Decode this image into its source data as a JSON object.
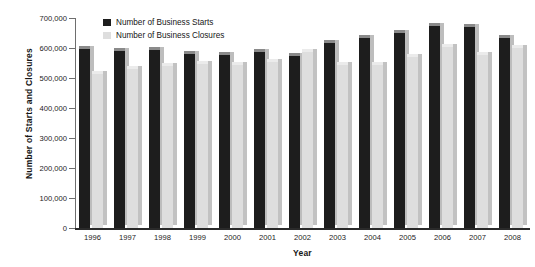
{
  "chart_data": {
    "type": "bar",
    "title": "",
    "xlabel": "Year",
    "ylabel": "Number of Starts and Closures",
    "categories": [
      "1996",
      "1997",
      "1998",
      "1999",
      "2000",
      "2001",
      "2002",
      "2003",
      "2004",
      "2005",
      "2006",
      "2007",
      "2008"
    ],
    "series": [
      {
        "name": "Number of Business Starts",
        "color": "#1d1d1d",
        "values": [
          598000,
          591000,
          593000,
          581000,
          577000,
          588000,
          573000,
          617000,
          633000,
          649000,
          675000,
          670000,
          633000
        ]
      },
      {
        "name": "Number of Business Closures",
        "color": "#dedede",
        "values": [
          512000,
          531000,
          541000,
          546000,
          543000,
          554000,
          587000,
          543000,
          544000,
          571000,
          604000,
          578000,
          601000
        ]
      }
    ],
    "ylim": [
      0,
      700000
    ],
    "yticks": [
      0,
      100000,
      200000,
      300000,
      400000,
      500000,
      600000,
      700000
    ],
    "ytick_labels": [
      "0",
      "100,000",
      "200,000",
      "300,000",
      "400,000",
      "500,000",
      "600,000",
      "700,000"
    ],
    "grid": false,
    "legend_position": "top-left"
  },
  "legend": {
    "items": [
      {
        "label": "Number of Business Starts",
        "swatch": "starts"
      },
      {
        "label": "Number of Business Closures",
        "swatch": "closures"
      }
    ]
  }
}
